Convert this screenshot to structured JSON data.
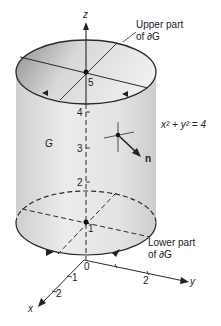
{
  "figure": {
    "axes": {
      "z_label": "z",
      "x_label": "x",
      "y_label": "y",
      "origin_label": "0",
      "x_ticks": [
        "1",
        "2"
      ],
      "y_ticks": [
        "2"
      ],
      "z_ticks": [
        "1",
        "2",
        "3",
        "4",
        "5"
      ]
    },
    "labels": {
      "upper_line1": "Upper part",
      "upper_line2": "of ∂G",
      "lower_line1": "Lower part",
      "lower_line2": "of ∂G",
      "region": "G",
      "equation": "x² + y² = 4",
      "normal": "n"
    },
    "colors": {
      "stroke": "#2a2a2a",
      "cylinder_fill": "#e4e4e4",
      "top_fill_dark": "#9a9a9a",
      "top_fill_light": "#e8e8e8",
      "background": "#ffffff"
    }
  }
}
